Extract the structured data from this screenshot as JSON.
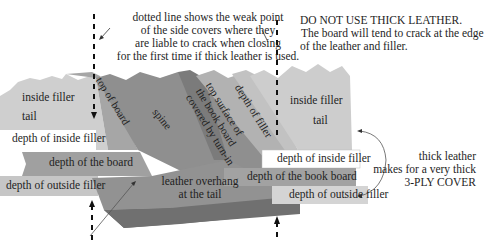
{
  "notes": {
    "dotted_line": [
      "dotted line shows the weak point",
      "of the side covers where they",
      "are liable to crack when closing",
      "for the first time if thick leather is used."
    ],
    "warning_title": "DO NOT USE THICK LEATHER.",
    "warning_body": [
      "The board will tend to crack at the edge",
      "of the leather and filler."
    ],
    "thick_leather": [
      "thick leather",
      "makes for a very thick",
      "3-PLY COVER"
    ]
  },
  "left": {
    "inside_filler": "inside filler",
    "tail": "tail",
    "depth_inside_filler": "depth of inside filler",
    "depth_board": "depth of the board",
    "depth_outside_filler": "depth of outside filler"
  },
  "center": {
    "top_of_board": "top of board",
    "spine": "spine",
    "top_surface": [
      "top surface of",
      "the book board",
      "covered by turn-in"
    ],
    "depth_of_filler": "depth of filler",
    "leather_overhang": [
      "leather overhang",
      "at the tail"
    ]
  },
  "right": {
    "inside_filler": "inside filler",
    "tail": "tail",
    "depth_inside_filler": "depth of inside filler",
    "depth_book_board": "depth of  the book board",
    "depth_outside_filler": "depth of outside filler"
  },
  "colors": {
    "light_grey": "#c8c8c8",
    "mid_grey": "#a8a8a8",
    "dark_grey": "#8a8a8a",
    "darker_grey": "#6e6e6e",
    "text": "#1e1e1e"
  }
}
